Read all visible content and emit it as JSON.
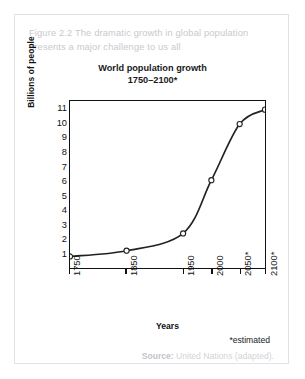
{
  "figure": {
    "caption": "Figure 2.2 The dramatic growth in global population presents a major challenge to us all",
    "estimated_note": "*estimated",
    "source_label": "Source:",
    "source_text": " United Nations (adapted)."
  },
  "colors": {
    "caption_text": "#c9c9cd",
    "axis": "#111111",
    "line": "#222222",
    "marker_fill": "#ffffff",
    "card_border": "#e2e2e4",
    "source_text": "#d3d3d7"
  },
  "chart_data": {
    "type": "line",
    "title": "World population growth 1750–2100*",
    "title_lines": [
      "World population growth",
      "1750–2100*"
    ],
    "xlabel": "Years",
    "ylabel": "Billions of people",
    "x": [
      "1750",
      "1850",
      "1950",
      "2000",
      "2050*",
      "2100*"
    ],
    "x_tick_labels": [
      "1750",
      "1850",
      "1950",
      "2000",
      "2050*",
      "2100*"
    ],
    "x_tick_positions_pct": [
      0,
      29.0,
      58.0,
      72.5,
      87.0,
      100
    ],
    "values": [
      0.8,
      1.2,
      2.4,
      6.1,
      10.0,
      11.0
    ],
    "y_tick_labels": [
      "11",
      "10",
      "9",
      "8",
      "7",
      "6",
      "5",
      "4",
      "3",
      "2",
      "1"
    ],
    "ylim": [
      0,
      11.6
    ],
    "grid": false,
    "legend": "none",
    "markers": "open-circle",
    "annotations": [
      "*estimated"
    ]
  }
}
